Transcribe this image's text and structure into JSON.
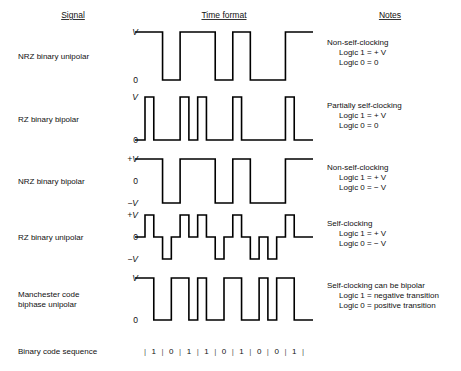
{
  "headers": {
    "signal": "Signal",
    "time_format": "Time format",
    "notes": "Notes"
  },
  "bit_sequence": {
    "label": "Binary code sequence",
    "bits": [
      "1",
      "0",
      "1",
      "1",
      "0",
      "1",
      "0",
      "0",
      "1"
    ],
    "separator": "|"
  },
  "geometry": {
    "wave_left": 145,
    "wave_right": 303,
    "label_x": 138,
    "note_x": 327,
    "signame_x": 18
  },
  "rows": [
    {
      "id": "nrz-binary-unipolar",
      "name_lines": [
        "NRZ binary unipolar"
      ],
      "levels": [
        "V",
        "0"
      ],
      "level_style": [
        "italic",
        "plain"
      ],
      "encoding": "nrz-unipolar",
      "notes": [
        {
          "text": "Non-self-clocking",
          "indent": 0
        },
        {
          "text": "Logic 1 = + V",
          "indent": 1
        },
        {
          "text": "Logic 0 = 0",
          "indent": 1
        }
      ],
      "top": 32,
      "bottom": 80
    },
    {
      "id": "rz-binary-bipolar",
      "name_lines": [
        "RZ binary bipolar"
      ],
      "levels": [
        "V",
        "0"
      ],
      "level_style": [
        "italic",
        "plain"
      ],
      "encoding": "rz-unipolar",
      "notes": [
        {
          "text": "Partially self-clocking",
          "indent": 0
        },
        {
          "text": "Logic 1 = + V",
          "indent": 1
        },
        {
          "text": "Logic 0 = 0",
          "indent": 1
        }
      ],
      "top": 97,
      "bottom": 140
    },
    {
      "id": "nrz-binary-bipolar",
      "name_lines": [
        "NRZ binary bipolar"
      ],
      "levels": [
        "+V",
        "0",
        "−V"
      ],
      "level_style": [
        "italic",
        "plain",
        "italic"
      ],
      "encoding": "nrz-bipolar",
      "notes": [
        {
          "text": "Non-self-clocking",
          "indent": 0
        },
        {
          "text": "Logic 1 = + V",
          "indent": 1
        },
        {
          "text": "Logic 0 = − V",
          "indent": 1
        }
      ],
      "top": 159,
      "bottom": 203
    },
    {
      "id": "rz-binary-unipolar",
      "name_lines": [
        "RZ binary unipolar"
      ],
      "levels": [
        "+V",
        "0",
        "−V"
      ],
      "level_style": [
        "italic",
        "plain",
        "italic"
      ],
      "encoding": "rz-bipolar",
      "notes": [
        {
          "text": "Self-clocking",
          "indent": 0
        },
        {
          "text": "Logic 1 = + V",
          "indent": 1
        },
        {
          "text": "Logic 0 = − V",
          "indent": 1
        }
      ],
      "top": 215,
      "bottom": 259
    },
    {
      "id": "manchester-code-biphase-unipolar",
      "name_lines": [
        "Manchester code",
        "biphase unipolar"
      ],
      "levels": [
        "V",
        "0"
      ],
      "level_style": [
        "italic",
        "plain"
      ],
      "encoding": "manchester",
      "notes": [
        {
          "text": "Self-clocking can be bipolar",
          "indent": 0
        },
        {
          "text": "Logic 1 = negative transition",
          "indent": 1
        },
        {
          "text": "Logic 0 = positive transition",
          "indent": 1
        }
      ],
      "top": 278,
      "bottom": 320
    }
  ],
  "chart_data": {
    "type": "line",
    "xlabel": "Time format",
    "ylabel": "Signal level",
    "categories": [
      "1",
      "0",
      "1",
      "1",
      "0",
      "1",
      "0",
      "0",
      "1"
    ],
    "series": [
      {
        "name": "NRZ binary unipolar",
        "levels": "V / 0",
        "values": [
          1,
          0,
          1,
          1,
          0,
          1,
          0,
          0,
          1
        ]
      },
      {
        "name": "RZ binary bipolar",
        "levels": "V / 0",
        "values": [
          1,
          0,
          1,
          1,
          0,
          1,
          0,
          0,
          1
        ]
      },
      {
        "name": "NRZ binary bipolar",
        "levels": "+V / −V",
        "values": [
          1,
          -1,
          1,
          1,
          -1,
          1,
          -1,
          -1,
          1
        ]
      },
      {
        "name": "RZ binary unipolar",
        "levels": "+V / 0 / −V",
        "values": [
          1,
          -1,
          1,
          1,
          -1,
          1,
          -1,
          -1,
          1
        ]
      },
      {
        "name": "Manchester code biphase unipolar",
        "levels": "V / 0",
        "values": [
          1,
          0,
          1,
          1,
          0,
          1,
          0,
          0,
          1
        ]
      }
    ],
    "legend": "none",
    "grid": false
  }
}
